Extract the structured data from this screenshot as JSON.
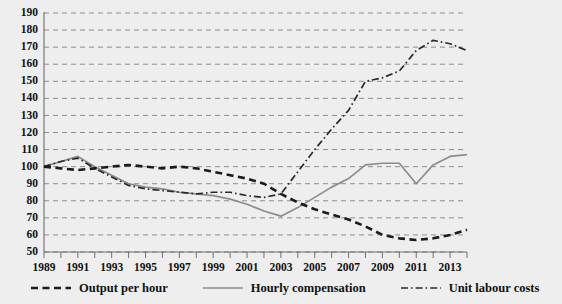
{
  "chart_data": {
    "type": "line",
    "title": "",
    "subtitle": "",
    "xlabel": "",
    "ylabel": "",
    "xlim": [
      1989,
      2014
    ],
    "ylim": [
      50,
      190
    ],
    "y_ticks": [
      50,
      60,
      70,
      80,
      90,
      100,
      110,
      120,
      130,
      140,
      150,
      160,
      170,
      180,
      190
    ],
    "x_ticks": [
      1989,
      1990,
      1991,
      1992,
      1993,
      1994,
      1995,
      1996,
      1997,
      1998,
      1999,
      2000,
      2001,
      2002,
      2003,
      2004,
      2005,
      2006,
      2007,
      2008,
      2009,
      2010,
      2011,
      2012,
      2013,
      2014
    ],
    "x_tick_labels": [
      "1989",
      "",
      "1991",
      "",
      "1993",
      "",
      "1995",
      "",
      "1997",
      "",
      "1999",
      "",
      "2001",
      "",
      "2003",
      "",
      "2005",
      "",
      "2007",
      "",
      "2009",
      "",
      "2011",
      "",
      "2013",
      ""
    ],
    "grid": "horizontal",
    "legend_position": "bottom",
    "x": [
      1989,
      1990,
      1991,
      1992,
      1993,
      1994,
      1995,
      1996,
      1997,
      1998,
      1999,
      2000,
      2001,
      2002,
      2003,
      2004,
      2005,
      2006,
      2007,
      2008,
      2009,
      2010,
      2011,
      2012,
      2013,
      2014
    ],
    "series": [
      {
        "name": "Output per hour",
        "style": "dashed",
        "color": "#1b1b1b",
        "values": [
          100,
          99,
          98,
          99,
          100,
          101,
          100,
          99,
          100,
          99,
          97,
          95,
          93,
          90,
          84,
          79,
          75,
          72,
          69,
          65,
          60,
          58,
          57,
          58,
          60,
          63
        ]
      },
      {
        "name": "Hourly compensation",
        "style": "solid",
        "color": "#8c8c8c",
        "values": [
          100,
          103,
          106,
          100,
          95,
          90,
          88,
          87,
          85,
          84,
          83,
          81,
          78,
          74,
          71,
          76,
          82,
          88,
          93,
          101,
          102,
          102,
          90,
          101,
          106,
          107
        ]
      },
      {
        "name": "Unit labour costs",
        "style": "dash-dot",
        "color": "#2a2a2a",
        "values": [
          100,
          103,
          105,
          99,
          94,
          89,
          87,
          86,
          85,
          84,
          85,
          85,
          83,
          82,
          84,
          97,
          110,
          122,
          133,
          150,
          152,
          156,
          168,
          174,
          172,
          168
        ]
      }
    ]
  },
  "legend": {
    "items": [
      {
        "label": "Output per hour",
        "icon": "dashed-line-icon"
      },
      {
        "label": "Hourly compensation",
        "icon": "solid-line-icon"
      },
      {
        "label": "Unit labour costs",
        "icon": "dash-dot-line-icon"
      }
    ]
  }
}
